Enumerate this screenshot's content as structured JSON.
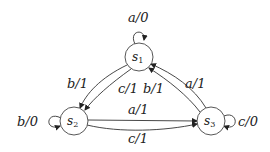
{
  "diagram": {
    "type": "finite-state-machine",
    "nodes": [
      {
        "id": "s1",
        "base": "s",
        "sub": "1"
      },
      {
        "id": "s2",
        "base": "s",
        "sub": "2"
      },
      {
        "id": "s3",
        "base": "s",
        "sub": "3"
      }
    ],
    "edges": [
      {
        "from": "s1",
        "to": "s1",
        "label": "a/0"
      },
      {
        "from": "s1",
        "to": "s2",
        "label": "b/1"
      },
      {
        "from": "s1",
        "to": "s2",
        "label": "c/1"
      },
      {
        "from": "s3",
        "to": "s1",
        "label": "b/1"
      },
      {
        "from": "s3",
        "to": "s1",
        "label": "a/1"
      },
      {
        "from": "s2",
        "to": "s2",
        "label": "b/0"
      },
      {
        "from": "s2",
        "to": "s3",
        "label": "a/1"
      },
      {
        "from": "s2",
        "to": "s3",
        "label": "c/1"
      },
      {
        "from": "s3",
        "to": "s3",
        "label": "c/0"
      }
    ]
  }
}
